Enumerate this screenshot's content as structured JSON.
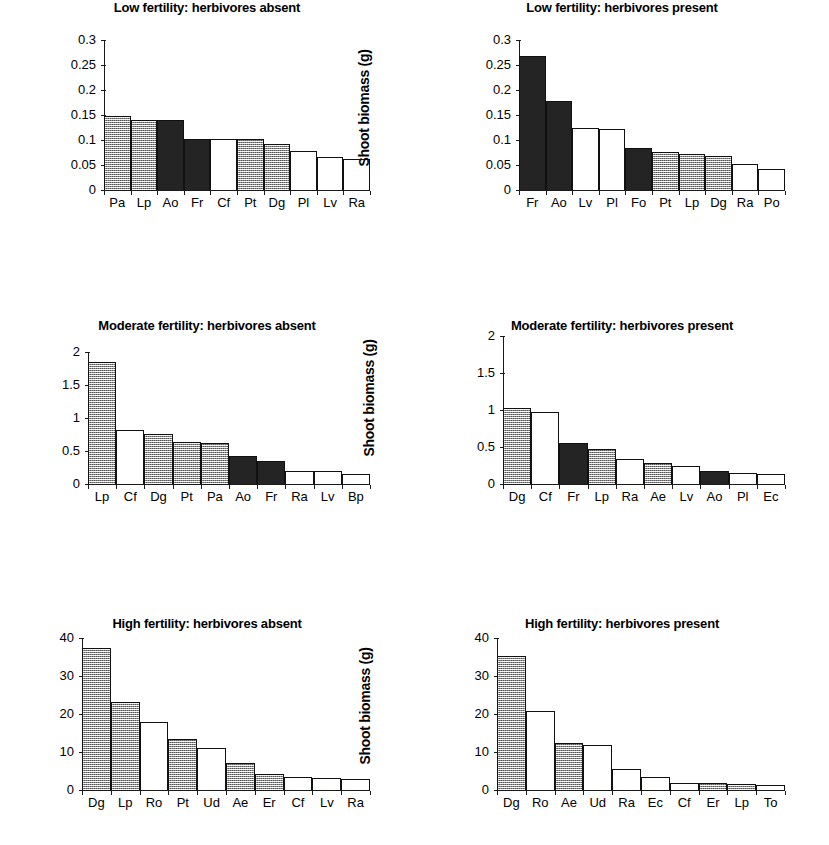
{
  "figure": {
    "ylabel": "Shoot biomass (g)",
    "legend_fills": {
      "gray": "#b9b9b9",
      "black": "#242424",
      "white": "#ffffff"
    }
  },
  "chart_data": [
    {
      "type": "bar",
      "title": "Low fertility: herbivores absent",
      "xlabel": "",
      "ylabel": "Shoot biomass (g)",
      "ylim": [
        0,
        0.3
      ],
      "yticks": [
        0,
        0.05,
        0.1,
        0.15,
        0.2,
        0.25,
        0.3
      ],
      "ytick_labels": [
        "0",
        "0.05",
        "0.1",
        "0.15",
        "0.2",
        "0.25",
        "0.3"
      ],
      "grid": false,
      "legend": "none",
      "categories": [
        "Pa",
        "Lp",
        "Ao",
        "Fr",
        "Cf",
        "Pt",
        "Dg",
        "Pl",
        "Lv",
        "Ra"
      ],
      "values": [
        0.148,
        0.141,
        0.14,
        0.103,
        0.103,
        0.102,
        0.092,
        0.078,
        0.067,
        0.062
      ],
      "fills": [
        "gray",
        "gray",
        "black",
        "black",
        "white",
        "gray",
        "gray",
        "white",
        "white",
        "white"
      ]
    },
    {
      "type": "bar",
      "title": "Low fertility: herbivores present",
      "xlabel": "",
      "ylabel": "Shoot biomass (g)",
      "ylim": [
        0,
        0.3
      ],
      "yticks": [
        0,
        0.05,
        0.1,
        0.15,
        0.2,
        0.25,
        0.3
      ],
      "ytick_labels": [
        "0",
        "0.05",
        "0.1",
        "0.15",
        "0.2",
        "0.25",
        "0.3"
      ],
      "grid": false,
      "legend": "none",
      "categories": [
        "Fr",
        "Ao",
        "Lv",
        "Pl",
        "Fo",
        "Pt",
        "Lp",
        "Dg",
        "Ra",
        "Po"
      ],
      "values": [
        0.268,
        0.178,
        0.124,
        0.123,
        0.085,
        0.076,
        0.073,
        0.069,
        0.053,
        0.042
      ],
      "fills": [
        "black",
        "black",
        "white",
        "white",
        "black",
        "gray",
        "gray",
        "gray",
        "white",
        "white"
      ]
    },
    {
      "type": "bar",
      "title": "Moderate fertility: herbivores absent",
      "xlabel": "",
      "ylabel": "Shoot biomass (g)",
      "ylim": [
        0,
        2
      ],
      "yticks": [
        0,
        0.5,
        1,
        1.5,
        2
      ],
      "ytick_labels": [
        "0",
        "0.5",
        "1",
        "1.5",
        "2"
      ],
      "grid": false,
      "legend": "none",
      "categories": [
        "Lp",
        "Cf",
        "Dg",
        "Pt",
        "Pa",
        "Ao",
        "Fr",
        "Ra",
        "Lv",
        "Bp"
      ],
      "values": [
        1.85,
        0.82,
        0.76,
        0.63,
        0.62,
        0.42,
        0.35,
        0.2,
        0.19,
        0.15
      ],
      "fills": [
        "gray",
        "white",
        "gray",
        "gray",
        "gray",
        "black",
        "black",
        "white",
        "white",
        "white"
      ]
    },
    {
      "type": "bar",
      "title": "Moderate fertility: herbivores present",
      "xlabel": "",
      "ylabel": "Shoot biomass (g)",
      "ylim": [
        0,
        2
      ],
      "yticks": [
        0,
        0.5,
        1,
        1.5,
        2
      ],
      "ytick_labels": [
        "0",
        "0.5",
        "1",
        "1.5",
        "2"
      ],
      "grid": false,
      "legend": "none",
      "categories": [
        "Dg",
        "Cf",
        "Fr",
        "Lp",
        "Ra",
        "Ae",
        "Lv",
        "Ao",
        "Pl",
        "Ec"
      ],
      "values": [
        1.03,
        0.97,
        0.55,
        0.47,
        0.34,
        0.28,
        0.25,
        0.18,
        0.15,
        0.14
      ],
      "fills": [
        "gray",
        "white",
        "black",
        "gray",
        "white",
        "gray",
        "white",
        "black",
        "white",
        "white"
      ]
    },
    {
      "type": "bar",
      "title": "High fertility: herbivores absent",
      "xlabel": "",
      "ylabel": "Shoot biomass (g)",
      "ylim": [
        0,
        40
      ],
      "yticks": [
        0,
        10,
        20,
        30,
        40
      ],
      "ytick_labels": [
        "0",
        "10",
        "20",
        "30",
        "40"
      ],
      "grid": false,
      "legend": "none",
      "categories": [
        "Dg",
        "Lp",
        "Ro",
        "Pt",
        "Ud",
        "Ae",
        "Er",
        "Cf",
        "Lv",
        "Ra"
      ],
      "values": [
        37.5,
        23.2,
        17.8,
        13.3,
        11.0,
        7.0,
        4.3,
        3.4,
        3.2,
        2.9
      ],
      "fills": [
        "gray",
        "gray",
        "white",
        "gray",
        "white",
        "gray",
        "gray",
        "white",
        "white",
        "white"
      ]
    },
    {
      "type": "bar",
      "title": "High fertility: herbivores present",
      "xlabel": "",
      "ylabel": "Shoot biomass (g)",
      "ylim": [
        0,
        40
      ],
      "yticks": [
        0,
        10,
        20,
        30,
        40
      ],
      "ytick_labels": [
        "0",
        "10",
        "20",
        "30",
        "40"
      ],
      "grid": false,
      "legend": "none",
      "categories": [
        "Dg",
        "Ro",
        "Ae",
        "Ud",
        "Ra",
        "Ec",
        "Cf",
        "Er",
        "Lp",
        "To"
      ],
      "values": [
        35.2,
        20.7,
        12.4,
        11.8,
        5.5,
        3.4,
        1.9,
        1.8,
        1.5,
        1.2
      ],
      "fills": [
        "gray",
        "white",
        "gray",
        "white",
        "white",
        "white",
        "white",
        "gray",
        "gray",
        "white"
      ]
    }
  ]
}
